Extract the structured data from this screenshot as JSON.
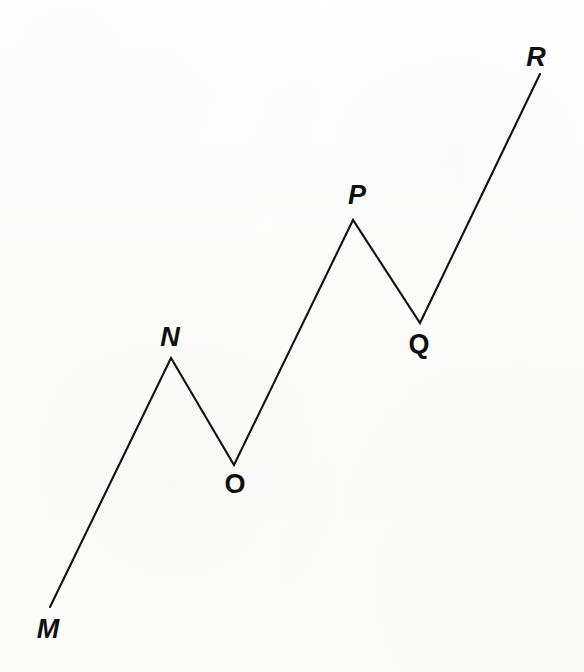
{
  "figure": {
    "width": 584,
    "height": 672,
    "background_color": "#fcfcfb",
    "stroke_color": "#111111",
    "stroke_width": 2.1,
    "label_color": "#101010"
  },
  "chart_data": {
    "type": "line",
    "title": "",
    "xlabel": "",
    "ylabel": "",
    "grid": false,
    "legend": "none",
    "xlim": [
      0,
      584
    ],
    "ylim": [
      672,
      0
    ],
    "series": [
      {
        "name": "path-M-N-O-P-Q-R",
        "x": [
          50,
          171,
          234,
          353,
          420,
          540
        ],
        "y": [
          607,
          358,
          465,
          220,
          323,
          74
        ],
        "point_labels": [
          "M",
          "N",
          "O",
          "P",
          "Q",
          "R"
        ]
      }
    ],
    "annotations": [
      {
        "text": "M",
        "x": 48,
        "y": 629,
        "style": "oblique"
      },
      {
        "text": "N",
        "x": 170,
        "y": 337,
        "style": "oblique"
      },
      {
        "text": "O",
        "x": 235,
        "y": 484,
        "style": "upright"
      },
      {
        "text": "P",
        "x": 357,
        "y": 195,
        "style": "oblique"
      },
      {
        "text": "Q",
        "x": 419,
        "y": 344,
        "style": "upright"
      },
      {
        "text": "R",
        "x": 536,
        "y": 57,
        "style": "oblique"
      }
    ]
  },
  "labels": {
    "m": "M",
    "n": "N",
    "o": "O",
    "p": "P",
    "q": "Q",
    "r": "R"
  },
  "path": {
    "points_d": "M 50 607 L 171 358 L 234 465 L 353 220 L 420 323 L 540 74"
  }
}
